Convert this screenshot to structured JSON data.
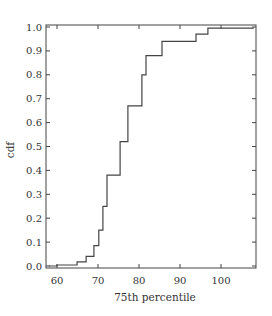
{
  "chart_data": {
    "type": "line",
    "subtype": "step-cdf",
    "title": "",
    "xlabel": "75th percentile",
    "ylabel": "cdf",
    "xlim": [
      57.3,
      108.5
    ],
    "ylim": [
      -0.005,
      1.0
    ],
    "xticks": [
      60,
      70,
      80,
      90,
      100
    ],
    "xtick_labels": [
      "60",
      "70",
      "80",
      "90",
      "100"
    ],
    "yticks": [
      0.0,
      0.1,
      0.2,
      0.3,
      0.4,
      0.5,
      0.6,
      0.7,
      0.8,
      0.9,
      1.0
    ],
    "ytick_labels": [
      "0.0",
      "0.1",
      "0.2",
      "0.3",
      "0.4",
      "0.5",
      "0.6",
      "0.7",
      "0.8",
      "0.9",
      "1.0"
    ],
    "grid": false,
    "legend": null,
    "series": [
      {
        "name": "cdf",
        "x": [
          58.0,
          60.0,
          64.9,
          67.1,
          69.0,
          70.2,
          71.2,
          72.2,
          75.4,
          77.3,
          80.7,
          81.7,
          85.6,
          93.9,
          96.8,
          108.0
        ],
        "y": [
          0.0,
          0.004,
          0.017,
          0.04,
          0.085,
          0.15,
          0.25,
          0.38,
          0.52,
          0.67,
          0.8,
          0.88,
          0.94,
          0.97,
          0.995,
          0.995
        ]
      }
    ]
  }
}
